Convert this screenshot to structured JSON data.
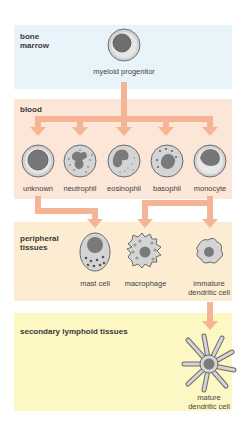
{
  "colors": {
    "bone_marrow_bg": "#e8f3fa",
    "blood_bg": "#fbe6d8",
    "peripheral_bg": "#fbecd2",
    "lymphoid_bg": "#fdf7c3",
    "arrow": "#f5b496",
    "cell_outer": "#cfcfcf",
    "cell_stroke": "#6b6b6b",
    "nucleus": "#7a7a7a"
  },
  "sections": {
    "bone_marrow": {
      "label_line1": "bone",
      "label_line2": "marrow"
    },
    "blood": {
      "label": "blood"
    },
    "peripheral": {
      "label_line1": "peripheral",
      "label_line2": "tissues"
    },
    "lymphoid": {
      "label": "secondary lymphoid tissues"
    }
  },
  "cells": {
    "progenitor": {
      "label": "myeloid progenitor"
    },
    "blood": [
      {
        "label": "unknown"
      },
      {
        "label": "neutrophil"
      },
      {
        "label": "eosinophil"
      },
      {
        "label": "basophil"
      },
      {
        "label": "monocyte"
      }
    ],
    "peripheral": [
      {
        "label": "mast cell"
      },
      {
        "label": "macrophage"
      },
      {
        "label_line1": "immature",
        "label_line2": "dendritic cell"
      }
    ],
    "lymphoid": {
      "label_line1": "mature",
      "label_line2": "dendritic cell"
    }
  }
}
